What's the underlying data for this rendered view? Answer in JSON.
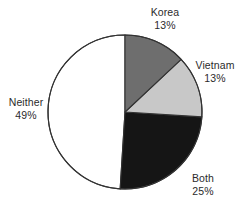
{
  "chart_data": {
    "type": "pie",
    "title": "",
    "subtitle": "",
    "xlabel": "",
    "ylabel": "",
    "legend_position": "none",
    "grid": false,
    "label_format": "name-above-percent",
    "start_angle_deg": 0,
    "direction": "clockwise",
    "categories": [
      "Korea",
      "Vietnam",
      "Both",
      "Neither"
    ],
    "values": [
      13,
      13,
      25,
      49
    ],
    "value_unit": "%",
    "slices": [
      {
        "label": "Korea",
        "percent_text": "13%",
        "value": 13,
        "color": "#6e6e6e",
        "start_deg": 0,
        "end_deg": 46.8
      },
      {
        "label": "Vietnam",
        "percent_text": "13%",
        "value": 13,
        "color": "#c8c8c8",
        "start_deg": 46.8,
        "end_deg": 93.6
      },
      {
        "label": "Both",
        "percent_text": "25%",
        "value": 25,
        "color": "#151515",
        "start_deg": 93.6,
        "end_deg": 183.6
      },
      {
        "label": "Neither",
        "percent_text": "49%",
        "value": 49,
        "color": "#ffffff",
        "start_deg": 183.6,
        "end_deg": 360
      }
    ],
    "geometry": {
      "center_x": 125,
      "center_y": 112,
      "radius": 77
    },
    "style": {
      "outline_color": "#333333",
      "text_color": "#2b2b2b",
      "background": "#ffffff"
    }
  }
}
